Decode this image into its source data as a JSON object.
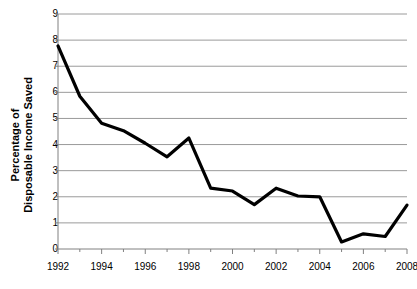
{
  "chart_data": {
    "type": "line",
    "title": "",
    "xlabel": "",
    "ylabel": "Percentage of Disposable Income Saved",
    "ylabel_line1": "Percentage of",
    "ylabel_line2": "Disposable Income Saved",
    "x": [
      1992,
      1993,
      1994,
      1995,
      1996,
      1997,
      1998,
      1999,
      2000,
      2001,
      2002,
      2003,
      2004,
      2005,
      2006,
      2007,
      2008
    ],
    "values": [
      7.78,
      5.85,
      4.82,
      4.53,
      4.05,
      3.53,
      4.25,
      2.33,
      2.22,
      1.7,
      2.33,
      2.03,
      2.0,
      0.27,
      0.58,
      0.48,
      1.68
    ],
    "series": [
      {
        "name": "Percentage of Disposable Income Saved",
        "values": [
          7.78,
          5.85,
          4.82,
          4.53,
          4.05,
          3.53,
          4.25,
          2.33,
          2.22,
          1.7,
          2.33,
          2.03,
          2.0,
          0.27,
          0.58,
          0.48,
          1.68
        ],
        "color": "#000000"
      }
    ],
    "xlim": [
      1992,
      2008
    ],
    "ylim": [
      0,
      9
    ],
    "y_ticks": [
      0,
      1,
      2,
      3,
      4,
      5,
      6,
      7,
      8,
      9
    ],
    "y_tick_labels": [
      "0",
      "1",
      "2",
      "3",
      "4",
      "5",
      "6",
      "7",
      "8",
      "9"
    ],
    "x_ticks_major": [
      1992,
      1994,
      1996,
      1998,
      2000,
      2002,
      2004,
      2006,
      2008
    ],
    "x_tick_labels": [
      "1992",
      "1994",
      "1996",
      "1998",
      "2000",
      "2002",
      "2004",
      "2006",
      "2008"
    ],
    "x_ticks_minor": [
      1993,
      1995,
      1997,
      1999,
      2001,
      2003,
      2005,
      2007
    ],
    "grid": "horizontal",
    "legend": "none",
    "colors": {
      "line": "#000000",
      "gridline": "#9a9a9a",
      "axis": "#808080",
      "background": "#ffffff",
      "text": "#000000"
    }
  }
}
